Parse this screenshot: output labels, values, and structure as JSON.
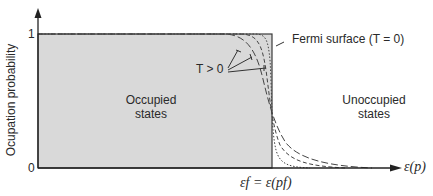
{
  "diagram": {
    "type": "fermi-dirac-occupation",
    "y_axis": {
      "label": "Ocupation probability",
      "ticks": [
        "1",
        "0"
      ]
    },
    "x_axis": {
      "label": "ε(p)",
      "fermi_level_label": "εf = ε(pf)"
    },
    "regions": {
      "occupied": "Occupied\nstates",
      "occupied_line1": "Occupied",
      "occupied_line2": "states",
      "unoccupied_line1": "Unoccupied",
      "unoccupied_line2": "states"
    },
    "annotations": {
      "fermi_surface": "Fermi surface (T = 0)",
      "temperature": "T > 0"
    },
    "curves": [
      {
        "name": "T=0 step",
        "style": "solid"
      },
      {
        "name": "low T",
        "style": "dotted"
      },
      {
        "name": "medium T",
        "style": "short-dashed"
      },
      {
        "name": "high T",
        "style": "long-dashed"
      }
    ],
    "colors": {
      "shade": "#d9d9d9",
      "line": "#2a2a2a"
    }
  }
}
